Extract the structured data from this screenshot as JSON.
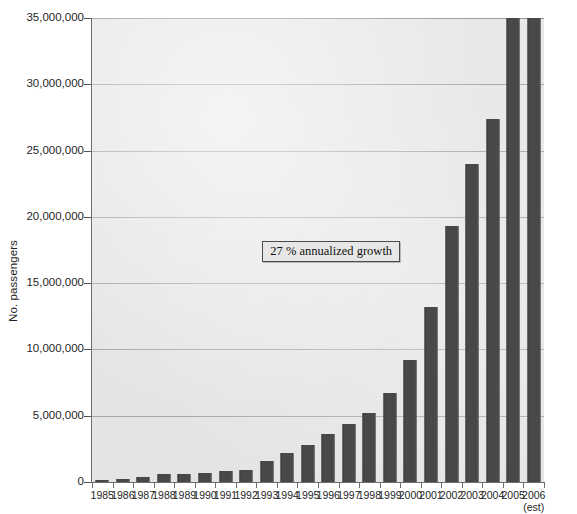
{
  "chart_data": {
    "type": "bar",
    "title": "",
    "xlabel": "",
    "ylabel": "No. passengers",
    "ylim": [
      0,
      35000000
    ],
    "ytick_step": 5000000,
    "grid": true,
    "legend": "none",
    "bar_color": "#484848",
    "plot_background": "#e6e6e6",
    "gridline_color": "#a8a8a8",
    "categories": [
      "1985",
      "1986",
      "1987",
      "1988",
      "1989",
      "1990",
      "1991",
      "1992",
      "1993",
      "1994",
      "1995",
      "1996",
      "1997",
      "1998",
      "1999",
      "2000",
      "2001",
      "2002",
      "2003",
      "2004",
      "2005",
      "2006"
    ],
    "values": [
      150000,
      210000,
      400000,
      620000,
      640000,
      660000,
      850000,
      900000,
      1600000,
      2200000,
      2800000,
      3600000,
      4400000,
      5200000,
      6700000,
      9200000,
      13200000,
      19300000,
      24000000,
      27400000,
      35000000,
      35000000
    ],
    "ytick_labels": [
      "35,000,000",
      "30,000,000",
      "25,000,000",
      "20,000,000",
      "15,000,000",
      "10,000,000",
      "5,000,000",
      "0"
    ],
    "ytick_values": [
      35000000,
      30000000,
      25000000,
      20000000,
      15000000,
      10000000,
      5000000,
      0
    ],
    "annotations": [
      {
        "text": "27 % annualized growth",
        "x_category": "1996",
        "y_value": 17500000
      }
    ],
    "x_sub_labels": [
      {
        "category": "2006",
        "text": "(est)"
      }
    ]
  }
}
